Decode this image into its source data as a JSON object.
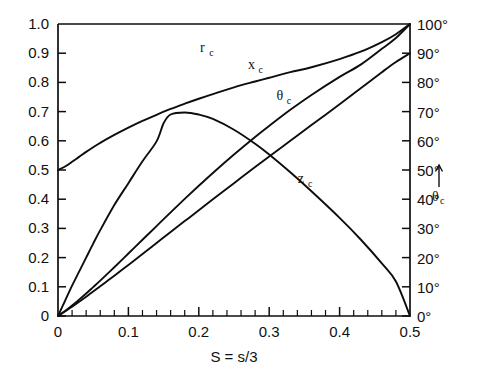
{
  "chart_data": {
    "type": "line",
    "title": "",
    "subtitle": "",
    "xlabel": "S = s/3",
    "ylabel": "",
    "ylabel_right": "θ_c",
    "xlim": [
      0,
      0.5
    ],
    "ylim": [
      0,
      1.0
    ],
    "ylim_right": [
      0,
      100
    ],
    "grid": false,
    "legend": "inline-curve-labels",
    "x_ticks": [
      0,
      0.1,
      0.2,
      0.3,
      0.4,
      0.5
    ],
    "x_tick_labels": [
      "0",
      "0.1",
      "0.2",
      "0.3",
      "0.4",
      "0.5"
    ],
    "x_minor_tick_step": 0.02,
    "y_ticks": [
      0,
      0.1,
      0.2,
      0.3,
      0.4,
      0.5,
      0.6,
      0.7,
      0.8,
      0.9,
      1.0
    ],
    "y_tick_labels": [
      "0",
      "0.1",
      "0.2",
      "0.3",
      "0.4",
      "0.5",
      "0.6",
      "0.7",
      "0.8",
      "0.9",
      "1.0"
    ],
    "y_right_ticks": [
      0,
      10,
      20,
      30,
      40,
      50,
      60,
      70,
      80,
      90,
      100
    ],
    "y_right_tick_labels": [
      "0°",
      "10°",
      "20°",
      "30°",
      "40°",
      "50°",
      "60°",
      "70°",
      "80°",
      "90°",
      "100°"
    ],
    "annotations": [
      {
        "name": "theta-axis-arrow",
        "text": "↑",
        "note": "upward arrow beside right axis near 50 degrees"
      }
    ],
    "series": [
      {
        "name": "r_c",
        "label_base": "r",
        "label_sub": "c",
        "axis": "left",
        "label_x": 0.205,
        "label_y": 0.905,
        "x": [
          0.0,
          0.01,
          0.02,
          0.03,
          0.04,
          0.05,
          0.06,
          0.08,
          0.1,
          0.12,
          0.14,
          0.16,
          0.18,
          0.2,
          0.22,
          0.25,
          0.28,
          0.3,
          0.33,
          0.36,
          0.4,
          0.43,
          0.46,
          0.48,
          0.5
        ],
        "y": [
          0.5,
          0.512,
          0.528,
          0.545,
          0.562,
          0.578,
          0.593,
          0.62,
          0.645,
          0.668,
          0.689,
          0.709,
          0.727,
          0.744,
          0.76,
          0.783,
          0.803,
          0.816,
          0.835,
          0.852,
          0.88,
          0.905,
          0.938,
          0.965,
          1.0
        ]
      },
      {
        "name": "x_c",
        "label_base": "x",
        "label_sub": "c",
        "axis": "left",
        "label_x": 0.275,
        "label_y": 0.845,
        "x": [
          0.0,
          0.01,
          0.02,
          0.03,
          0.04,
          0.05,
          0.06,
          0.08,
          0.1,
          0.12,
          0.14,
          0.16,
          0.18,
          0.2,
          0.22,
          0.25,
          0.28,
          0.3,
          0.33,
          0.36,
          0.4,
          0.43,
          0.46,
          0.48,
          0.5
        ],
        "y": [
          0.0,
          0.017,
          0.036,
          0.056,
          0.077,
          0.099,
          0.121,
          0.167,
          0.214,
          0.261,
          0.308,
          0.355,
          0.401,
          0.446,
          0.49,
          0.553,
          0.613,
          0.651,
          0.706,
          0.757,
          0.819,
          0.861,
          0.915,
          0.952,
          1.0
        ]
      },
      {
        "name": "z_c",
        "label_base": "z",
        "label_sub": "c",
        "axis": "left",
        "label_x": 0.345,
        "label_y": 0.455,
        "x": [
          0.0,
          0.01,
          0.02,
          0.03,
          0.04,
          0.05,
          0.06,
          0.08,
          0.1,
          0.12,
          0.14,
          0.15,
          0.16,
          0.18,
          0.2,
          0.22,
          0.25,
          0.28,
          0.3,
          0.33,
          0.36,
          0.4,
          0.43,
          0.46,
          0.48,
          0.5
        ],
        "y": [
          0.0,
          0.052,
          0.104,
          0.152,
          0.2,
          0.248,
          0.294,
          0.38,
          0.455,
          0.53,
          0.598,
          0.66,
          0.69,
          0.697,
          0.69,
          0.675,
          0.638,
          0.59,
          0.553,
          0.492,
          0.427,
          0.336,
          0.262,
          0.18,
          0.118,
          0.0
        ]
      },
      {
        "name": "theta_c",
        "label_base": "θ",
        "label_sub": "c",
        "axis": "right",
        "label_x": 0.315,
        "label_y_deg": 74,
        "x": [
          0.0,
          0.02,
          0.04,
          0.06,
          0.08,
          0.1,
          0.12,
          0.14,
          0.16,
          0.18,
          0.2,
          0.22,
          0.25,
          0.28,
          0.3,
          0.33,
          0.36,
          0.4,
          0.43,
          0.46,
          0.48,
          0.5
        ],
        "y": [
          0,
          3.2,
          6.6,
          10.2,
          13.8,
          17.5,
          21.2,
          25.0,
          28.8,
          32.5,
          36.2,
          40.0,
          45.5,
          51.0,
          54.6,
          60.0,
          65.4,
          72.5,
          78.0,
          83.5,
          87.0,
          90.0
        ]
      }
    ]
  },
  "axes": {
    "x_axis_name": "x-axis-s",
    "y_axis_left_name": "y-axis-fraction",
    "y_axis_right_name": "y-axis-degrees"
  }
}
